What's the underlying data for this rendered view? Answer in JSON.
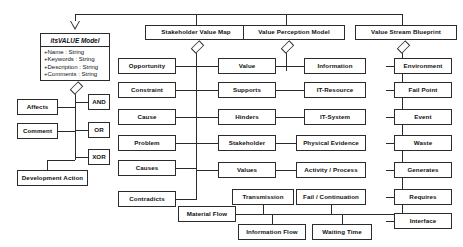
{
  "diagram": {
    "title": "itsVALUE Model",
    "root": {
      "name": "itsVALUE Model",
      "attributes": [
        "+Name : String",
        "+Keywords : String",
        "+Description : String",
        "+Comments : String"
      ]
    },
    "submodels": [
      {
        "label": "Stakeholder Value Map"
      },
      {
        "label": "Value Perception Model"
      },
      {
        "label": "Value Stream Blueprint"
      }
    ],
    "root_children": {
      "left": [
        {
          "label": "Affects"
        },
        {
          "label": "Comment"
        },
        {
          "label": "Development Action"
        }
      ],
      "right": [
        {
          "label": "AND"
        },
        {
          "label": "OR"
        },
        {
          "label": "XOR"
        }
      ]
    },
    "stakeholder_value_map": {
      "left": [
        {
          "label": "Opportunity"
        },
        {
          "label": "Constraint"
        },
        {
          "label": "Cause"
        },
        {
          "label": "Problem"
        },
        {
          "label": "Causes"
        },
        {
          "label": "Contradicts"
        }
      ],
      "right": [
        {
          "label": "Value"
        },
        {
          "label": "Supports"
        },
        {
          "label": "Hinders"
        },
        {
          "label": "Stakeholder"
        },
        {
          "label": "Values"
        }
      ]
    },
    "value_perception_model": {
      "right": [
        {
          "label": "Information"
        },
        {
          "label": "IT-Resource"
        },
        {
          "label": "IT-System"
        },
        {
          "label": "Physical Evidence"
        },
        {
          "label": "Activity / Process"
        },
        {
          "label": "Fail / Continuation"
        }
      ]
    },
    "value_stream_blueprint": {
      "right": [
        {
          "label": "Environment"
        },
        {
          "label": "Fail Point"
        },
        {
          "label": "Event"
        },
        {
          "label": "Waste"
        },
        {
          "label": "Generates"
        },
        {
          "label": "Requires"
        },
        {
          "label": "Interface"
        }
      ]
    },
    "flows": [
      {
        "label": "Material Flow"
      },
      {
        "label": "Transmission"
      },
      {
        "label": "Information Flow"
      },
      {
        "label": "Waiting Time"
      }
    ],
    "colors": {
      "stroke": "#2b2b2b",
      "fill": "#ffffff",
      "text": "#111111"
    }
  }
}
